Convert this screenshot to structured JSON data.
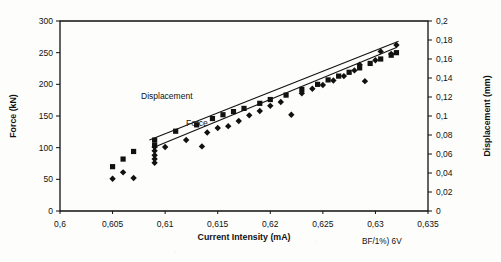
{
  "chart_data": {
    "type": "scatter",
    "title": "",
    "xlabel": "Current Intensity (mA)",
    "ylabel": "Force (kN)",
    "y2label": "Displacement (mm)",
    "xlim": [
      0.6,
      0.635
    ],
    "ylim": [
      0,
      300
    ],
    "y2lim": [
      0,
      0.2
    ],
    "grid": false,
    "legend_position": "inline-annotation",
    "decimal_separator": ",",
    "annotation": "BF/1%) 6V",
    "xticks": [
      0.6,
      0.605,
      0.61,
      0.615,
      0.62,
      0.625,
      0.63,
      0.635
    ],
    "xtick_labels": [
      "0,6",
      "0,605",
      "0,61",
      "0,615",
      "0,62",
      "0,625",
      "0,63",
      "0,635"
    ],
    "yticks": [
      0,
      50,
      100,
      150,
      200,
      250,
      300
    ],
    "ytick_labels": [
      "0",
      "50",
      "100",
      "150",
      "200",
      "250",
      "300"
    ],
    "y2ticks": [
      0,
      0.02,
      0.04,
      0.06,
      0.08,
      0.1,
      0.12,
      0.14,
      0.16,
      0.18,
      0.2
    ],
    "y2tick_labels": [
      "0",
      "0,02",
      "0,04",
      "0,06",
      "0,08",
      "0,1",
      "0,12",
      "0,14",
      "0,16",
      "0,18",
      "0,2"
    ],
    "series": [
      {
        "name": "Force",
        "marker": "diamond",
        "axis": "left",
        "inline_label": "Force",
        "points": [
          {
            "x": 0.605,
            "y": 51
          },
          {
            "x": 0.606,
            "y": 61
          },
          {
            "x": 0.607,
            "y": 52
          },
          {
            "x": 0.609,
            "y": 76
          },
          {
            "x": 0.609,
            "y": 82
          },
          {
            "x": 0.609,
            "y": 88
          },
          {
            "x": 0.609,
            "y": 95
          },
          {
            "x": 0.609,
            "y": 101
          },
          {
            "x": 0.61,
            "y": 101
          },
          {
            "x": 0.612,
            "y": 112
          },
          {
            "x": 0.6135,
            "y": 102
          },
          {
            "x": 0.614,
            "y": 124
          },
          {
            "x": 0.615,
            "y": 131
          },
          {
            "x": 0.616,
            "y": 134
          },
          {
            "x": 0.617,
            "y": 142
          },
          {
            "x": 0.618,
            "y": 151
          },
          {
            "x": 0.619,
            "y": 158
          },
          {
            "x": 0.62,
            "y": 166
          },
          {
            "x": 0.621,
            "y": 172
          },
          {
            "x": 0.622,
            "y": 152
          },
          {
            "x": 0.623,
            "y": 186
          },
          {
            "x": 0.624,
            "y": 193
          },
          {
            "x": 0.625,
            "y": 199
          },
          {
            "x": 0.626,
            "y": 206
          },
          {
            "x": 0.627,
            "y": 213
          },
          {
            "x": 0.628,
            "y": 222
          },
          {
            "x": 0.6285,
            "y": 231
          },
          {
            "x": 0.629,
            "y": 205
          },
          {
            "x": 0.63,
            "y": 238
          },
          {
            "x": 0.6305,
            "y": 252
          },
          {
            "x": 0.6315,
            "y": 248
          },
          {
            "x": 0.632,
            "y": 262
          }
        ],
        "trend_line": {
          "x1": 0.609,
          "y1": 101,
          "x2": 0.632,
          "y2": 258
        }
      },
      {
        "name": "Displacement",
        "marker": "square",
        "axis": "right",
        "inline_label": "Displacement",
        "points": [
          {
            "x": 0.605,
            "y": 70
          },
          {
            "x": 0.606,
            "y": 82
          },
          {
            "x": 0.607,
            "y": 94
          },
          {
            "x": 0.609,
            "y": 104
          },
          {
            "x": 0.609,
            "y": 112
          },
          {
            "x": 0.611,
            "y": 126
          },
          {
            "x": 0.613,
            "y": 136
          },
          {
            "x": 0.6145,
            "y": 146
          },
          {
            "x": 0.6155,
            "y": 152
          },
          {
            "x": 0.6165,
            "y": 157
          },
          {
            "x": 0.6175,
            "y": 162
          },
          {
            "x": 0.619,
            "y": 170
          },
          {
            "x": 0.62,
            "y": 176
          },
          {
            "x": 0.6215,
            "y": 183
          },
          {
            "x": 0.623,
            "y": 192
          },
          {
            "x": 0.6245,
            "y": 200
          },
          {
            "x": 0.6255,
            "y": 207
          },
          {
            "x": 0.6265,
            "y": 213
          },
          {
            "x": 0.6275,
            "y": 219
          },
          {
            "x": 0.6285,
            "y": 226
          },
          {
            "x": 0.6295,
            "y": 233
          },
          {
            "x": 0.6305,
            "y": 240
          },
          {
            "x": 0.6315,
            "y": 246
          },
          {
            "x": 0.632,
            "y": 250
          }
        ],
        "trend_line": {
          "x1": 0.6085,
          "y1": 112,
          "x2": 0.6322,
          "y2": 268
        }
      }
    ]
  }
}
